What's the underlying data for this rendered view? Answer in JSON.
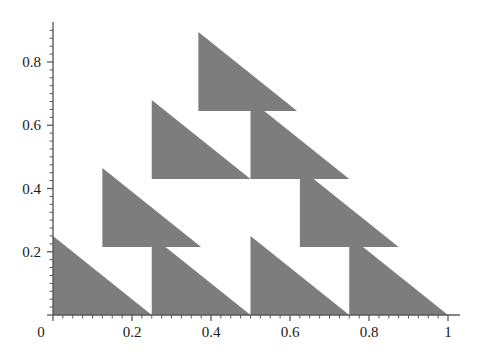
{
  "figure": {
    "title": "",
    "background_color": "#ffffff",
    "width": 487,
    "height": 354
  },
  "chart_data": {
    "type": "area",
    "title": "",
    "xlabel": "",
    "ylabel": "",
    "xlim": [
      0,
      1.04
    ],
    "ylim": [
      0,
      0.96
    ],
    "grid": false,
    "legend": null,
    "fill_color": "#7d7d7d",
    "axis_color": "#5a5a5a",
    "tick_label_color": "#1a1a1a",
    "x_ticks": [
      0,
      0.2,
      0.4,
      0.6,
      0.8,
      1
    ],
    "x_tick_labels": [
      "0",
      "0.2",
      "0.4",
      "0.6",
      "0.8",
      "1"
    ],
    "y_ticks": [
      0,
      0.2,
      0.4,
      0.6,
      0.8
    ],
    "y_tick_labels": [
      "0",
      "0.2",
      "0.4",
      "0.6",
      "0.8"
    ],
    "x_minor_tick_step": 0.025,
    "y_minor_tick_step": 0.025,
    "cell_size": 0.25,
    "triangles": [
      {
        "name": "row0-col0",
        "x0": 0.0,
        "y0": 0.0,
        "legx": 0.25,
        "legy": 0.25
      },
      {
        "name": "row0-col1",
        "x0": 0.25,
        "y0": 0.0,
        "legx": 0.25,
        "legy": 0.25
      },
      {
        "name": "row0-col2",
        "x0": 0.5,
        "y0": 0.0,
        "legx": 0.25,
        "legy": 0.25
      },
      {
        "name": "row0-col3",
        "x0": 0.75,
        "y0": 0.0,
        "legx": 0.25,
        "legy": 0.25
      },
      {
        "name": "row1-col0",
        "x0": 0.125,
        "y0": 0.215,
        "legx": 0.25,
        "legy": 0.25
      },
      {
        "name": "row1-col2",
        "x0": 0.625,
        "y0": 0.215,
        "legx": 0.25,
        "legy": 0.25
      },
      {
        "name": "row2-col0",
        "x0": 0.25,
        "y0": 0.43,
        "legx": 0.25,
        "legy": 0.25
      },
      {
        "name": "row2-col1",
        "x0": 0.5,
        "y0": 0.43,
        "legx": 0.25,
        "legy": 0.25
      },
      {
        "name": "row3-col0",
        "x0": 0.368,
        "y0": 0.645,
        "legx": 0.25,
        "legy": 0.25
      }
    ]
  },
  "axes": {
    "x_axis_name": "x-axis",
    "y_axis_name": "y-axis",
    "origin_label": "0"
  }
}
